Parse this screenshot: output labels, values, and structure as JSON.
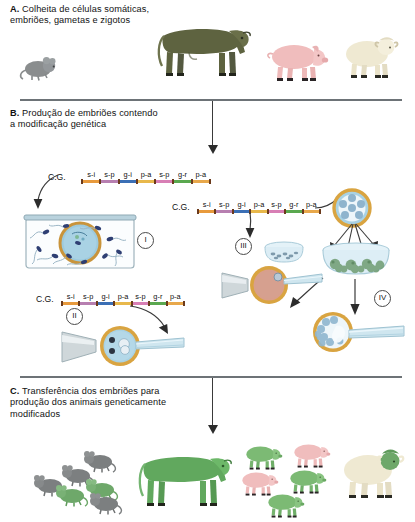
{
  "figure": {
    "title_alt": "Producao de animais geneticamente modificados",
    "sections": [
      {
        "key": "A",
        "letter": "A.",
        "text": "Colheita de células somáticas, embriões, gametas e zigotos"
      },
      {
        "key": "B",
        "letter": "B.",
        "text": "Produção de embriões contendo a modificação genética"
      },
      {
        "key": "C",
        "letter": "C.",
        "text": "Transferência dos embriões para produção dos animais geneticamente modificados"
      }
    ]
  },
  "constructs": [
    {
      "id": "cg-1",
      "label": "C.G.",
      "segments": [
        {
          "name": "s-i",
          "color": "#e89a3c"
        },
        {
          "name": "s-p",
          "color": "#b77fb0"
        },
        {
          "name": "g-i",
          "color": "#3b6fb5"
        },
        {
          "name": "p-a",
          "color": "#e8b84b"
        },
        {
          "name": "s-p",
          "color": "#d87fb5"
        },
        {
          "name": "g-r",
          "color": "#5aa84f"
        },
        {
          "name": "p-a",
          "color": "#e8a84b"
        }
      ]
    },
    {
      "id": "cg-2",
      "label": "C.G.",
      "segments": [
        {
          "name": "s-i",
          "color": "#e89a3c"
        },
        {
          "name": "s-p",
          "color": "#b77fb0"
        },
        {
          "name": "g-i",
          "color": "#3b6fb5"
        },
        {
          "name": "p-a",
          "color": "#e8b84b"
        },
        {
          "name": "s-p",
          "color": "#d87fb5"
        },
        {
          "name": "g-r",
          "color": "#5aa84f"
        },
        {
          "name": "p-a",
          "color": "#e8a84b"
        }
      ]
    },
    {
      "id": "cg-3",
      "label": "C.G.",
      "segments": [
        {
          "name": "s-i",
          "color": "#e89a3c"
        },
        {
          "name": "s-p",
          "color": "#b77fb0"
        },
        {
          "name": "g-i",
          "color": "#3b6fb5"
        },
        {
          "name": "p-a",
          "color": "#e8b84b"
        },
        {
          "name": "s-p",
          "color": "#d87fb5"
        },
        {
          "name": "g-r",
          "color": "#5aa84f"
        },
        {
          "name": "p-a",
          "color": "#e8a84b"
        }
      ]
    }
  ],
  "steps": [
    {
      "id": "step-1",
      "numeral": "I",
      "caption_alt": "Placa de fertilizacao com ovocito e espermatozoides"
    },
    {
      "id": "step-2",
      "numeral": "II",
      "caption_alt": "Microinjecao pronuclear em zigoto"
    },
    {
      "id": "step-3",
      "numeral": "III",
      "caption_alt": "Transfeccao de celulas em placa de cultivo"
    },
    {
      "id": "step-4",
      "numeral": "IV",
      "caption_alt": "Transferencia nuclear / injecao de celulas em blastocisto"
    }
  ],
  "animals_top": [
    {
      "id": "mouse",
      "name": "camundongo",
      "color": "#8a8d8e"
    },
    {
      "id": "cow",
      "name": "bovino",
      "color": "#5e6340"
    },
    {
      "id": "pig",
      "name": "suíno",
      "color": "#f0bdbd"
    },
    {
      "id": "sheep",
      "name": "ovino",
      "color": "#efe9d2"
    }
  ],
  "animals_bottom": [
    {
      "id": "mice-gm",
      "name": "camundongos modificados",
      "color": "#6ea86a",
      "wild_color": "#7c7f80"
    },
    {
      "id": "cow-gm",
      "name": "bovino modificado",
      "color": "#61a85e"
    },
    {
      "id": "pigs-gm",
      "name": "suínos modificados",
      "color": "#7cba74",
      "wild_color": "#f0bdbd"
    },
    {
      "id": "sheep-gm",
      "name": "ovino modificado",
      "color": "#efe9d2",
      "head_color": "#6ea86a"
    }
  ],
  "palette": {
    "divider": "#6d7377",
    "arrow": "#2c2c2c",
    "zona": "#d9a441",
    "cytoplasm": "#a9cfe0",
    "dish_glass": "#cfe6ef",
    "text": "#121212"
  }
}
